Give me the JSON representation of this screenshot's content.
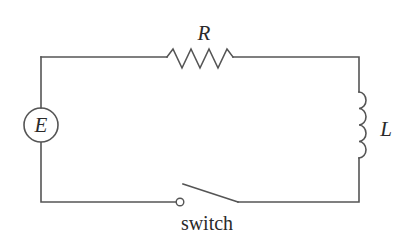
{
  "diagram": {
    "type": "circuit",
    "components": {
      "resistor": {
        "label": "R"
      },
      "source": {
        "label": "E"
      },
      "inductor": {
        "label": "L"
      },
      "switch": {
        "label": "switch",
        "state": "open"
      }
    },
    "colors": {
      "line": "#555555",
      "text": "#2a2a2a",
      "background": "#ffffff"
    }
  }
}
